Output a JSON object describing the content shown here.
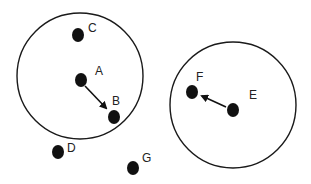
{
  "diagram": {
    "type": "neighborhood-clusters",
    "colors": {
      "stroke": "#1a1a1a",
      "dot": "#111111",
      "label": "#222222",
      "background": "#ffffff"
    },
    "circles": [
      {
        "id": "left-circle",
        "cx": 80,
        "cy": 76,
        "r": 63
      },
      {
        "id": "right-circle",
        "cx": 233,
        "cy": 105,
        "r": 63
      }
    ],
    "points": [
      {
        "label": "A",
        "x": 81,
        "y": 80,
        "lx": 95,
        "ly": 75
      },
      {
        "label": "B",
        "x": 114,
        "y": 117,
        "lx": 112,
        "ly": 105
      },
      {
        "label": "C",
        "x": 78,
        "y": 35,
        "lx": 88,
        "ly": 32
      },
      {
        "label": "D",
        "x": 58,
        "y": 152,
        "lx": 67,
        "ly": 152
      },
      {
        "label": "E",
        "x": 233,
        "y": 110,
        "lx": 249,
        "ly": 99
      },
      {
        "label": "F",
        "x": 192,
        "y": 92,
        "lx": 196,
        "ly": 81
      },
      {
        "label": "G",
        "x": 133,
        "y": 168,
        "lx": 142,
        "ly": 162
      }
    ],
    "arrows": [
      {
        "from": "A",
        "to": "B"
      },
      {
        "from": "E",
        "to": "F"
      }
    ]
  }
}
